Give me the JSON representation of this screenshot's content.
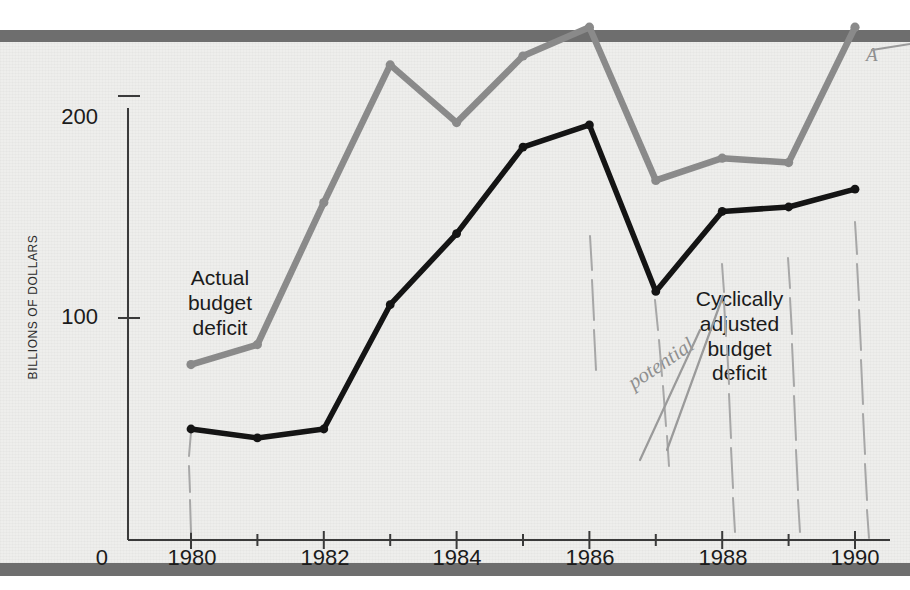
{
  "figure": {
    "y_axis_label": "BILLIONS OF DOLLARS",
    "y_ticks": [
      "200",
      "100",
      "0"
    ],
    "x_ticks": [
      "1980",
      "1982",
      "1984",
      "1986",
      "1988",
      "1990"
    ],
    "origin_label": "0",
    "annotations": {
      "actual": "Actual\nbudget\ndeficit",
      "actual_line1": "Actual",
      "actual_line2": "budget",
      "actual_line3": "deficit",
      "cyclical_line1": "Cyclically",
      "cyclical_line2": "adjusted",
      "cyclical_line3": "budget",
      "cyclical_line4": "deficit",
      "handwritten_potential": "potential",
      "handwritten_mark": "A"
    },
    "colors": {
      "actual_series": "#8a8a8a",
      "cyclical_series": "#141414",
      "band": "#6e6e6e",
      "paper": "#eeeeec",
      "axis": "#3a3a3a",
      "pencil": "#9a9a9a"
    }
  },
  "chart_data": {
    "type": "line",
    "title": "",
    "xlabel": "",
    "ylabel": "BILLIONS OF DOLLARS",
    "x": [
      1980,
      1981,
      1982,
      1983,
      1984,
      1985,
      1986,
      1987,
      1988,
      1989,
      1990
    ],
    "xlim": [
      1979,
      1991
    ],
    "ylim": [
      0,
      245
    ],
    "yticks": [
      0,
      100,
      200
    ],
    "xticks": [
      1980,
      1981,
      1982,
      1983,
      1984,
      1985,
      1986,
      1987,
      1988,
      1989,
      1990
    ],
    "xticklabels_shown": [
      1980,
      1982,
      1984,
      1986,
      1988,
      1990
    ],
    "grid": false,
    "legend": "inline-annotations",
    "series": [
      {
        "name": "Actual budget deficit",
        "color": "#8a8a8a",
        "values": [
          79,
          88,
          152,
          214,
          188,
          218,
          231,
          162,
          172,
          170,
          231
        ]
      },
      {
        "name": "Cyclically adjusted budget deficit",
        "color": "#141414",
        "values": [
          50,
          46,
          50,
          106,
          138,
          177,
          187,
          112,
          148,
          150,
          158
        ]
      }
    ]
  }
}
